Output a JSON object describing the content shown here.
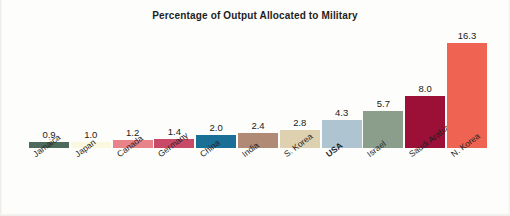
{
  "chart_data": {
    "type": "bar",
    "title": "Percentage of Output Allocated to Military",
    "xlabel": "",
    "ylabel": "",
    "ylim": [
      0,
      16.3
    ],
    "grid": false,
    "legend": false,
    "categories": [
      "Jamaica",
      "Japan",
      "Canada",
      "Germany",
      "China",
      "India",
      "S. Korea",
      "USA",
      "Israel",
      "Saudi Arabia",
      "N. Korea"
    ],
    "values": [
      0.9,
      1.0,
      1.2,
      1.4,
      2.0,
      2.4,
      2.8,
      4.3,
      5.7,
      8.0,
      16.3
    ],
    "value_labels": [
      "0.9",
      "1.0",
      "1.2",
      "1.4",
      "2.0",
      "2.4",
      "2.8",
      "4.3",
      "5.7",
      "8.0",
      "16.3"
    ],
    "bar_colors": [
      "#4d6b5c",
      "#fbf8e0",
      "#e8838a",
      "#c94a68",
      "#1a6f96",
      "#b08a74",
      "#ddd1b0",
      "#aec4d1",
      "#8a9e8b",
      "#9c1038",
      "#ef6352"
    ],
    "emphasized_category": "USA"
  }
}
